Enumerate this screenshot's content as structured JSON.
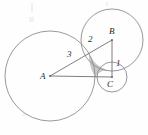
{
  "figure": {
    "type": "geometry-diagram",
    "background_color": "#fefefe",
    "stroke_color": "#8a8a8a",
    "line_color": "#6f6f6f",
    "shade_color": "#9a9a9a",
    "label_color": "#2b2b2b"
  },
  "points": [
    {
      "id": "A",
      "label": "A",
      "x": 50,
      "y": 76,
      "label_x": 40,
      "label_y": 72
    },
    {
      "id": "B",
      "label": "B",
      "x": 112,
      "y": 40,
      "label_x": 109,
      "label_y": 28
    },
    {
      "id": "C",
      "label": "C",
      "x": 112,
      "y": 77,
      "label_x": 107,
      "label_y": 80
    }
  ],
  "circles": [
    {
      "id": "circle-A",
      "center": "A",
      "cx": 50,
      "cy": 76,
      "r": 45,
      "radius_label": "3"
    },
    {
      "id": "circle-B",
      "center": "B",
      "cx": 112,
      "cy": 40,
      "r": 31,
      "radius_label": "2"
    },
    {
      "id": "circle-C",
      "center": "C",
      "cx": 112,
      "cy": 77,
      "r": 15,
      "radius_label": "1"
    }
  ],
  "segments": [
    {
      "id": "AB",
      "from": "A",
      "to": "B",
      "x1": 50,
      "y1": 76,
      "x2": 112,
      "y2": 40,
      "length_label": "2"
    },
    {
      "id": "AC",
      "from": "A",
      "to": "C",
      "x1": 50,
      "y1": 76,
      "x2": 112,
      "y2": 77,
      "length_label": "3"
    },
    {
      "id": "BC",
      "from": "B",
      "to": "C",
      "x1": 112,
      "y1": 40,
      "x2": 112,
      "y2": 77,
      "length_label": "1"
    }
  ],
  "length_labels": [
    {
      "id": "len-3",
      "text": "3",
      "x": 68,
      "y": 52,
      "for": "AC"
    },
    {
      "id": "len-2",
      "text": "2",
      "x": 89,
      "y": 36,
      "for": "AB"
    },
    {
      "id": "len-1",
      "text": "1",
      "x": 116,
      "y": 60,
      "for": "BC"
    }
  ],
  "shaded_region": {
    "id": "curvilinear-triangle",
    "label": "",
    "fill": "#9d9d9d",
    "opacity": 0.55
  },
  "chart_data": {
    "type": "scatter",
    "title": "",
    "xlabel": "",
    "ylabel": "",
    "categories": [
      "A",
      "B",
      "C"
    ],
    "series": [
      {
        "name": "circle radii",
        "values": [
          3,
          2,
          1
        ]
      }
    ],
    "annotations": [
      "A",
      "B",
      "C",
      "3",
      "2",
      "1"
    ]
  }
}
